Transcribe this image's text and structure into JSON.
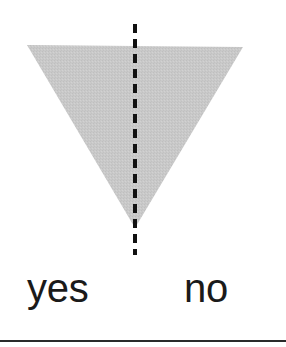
{
  "figure": {
    "canvas": {
      "width": 286,
      "height": 347,
      "background_color": "#ffffff"
    },
    "shape": {
      "name": "inverted-triangle",
      "type": "triangle",
      "orientation": "point-down",
      "fill_color": "#c9c9c9",
      "texture": "dithered-halftone",
      "vertices": [
        {
          "x": 27,
          "y": 45
        },
        {
          "x": 243,
          "y": 47
        },
        {
          "x": 135,
          "y": 228
        }
      ]
    },
    "symmetry_line": {
      "name": "vertical-dashed-axis",
      "orientation": "vertical",
      "color": "#111111",
      "x": 135,
      "y_start": 24,
      "y_end": 255,
      "stroke_width": 4,
      "dash_length": 9,
      "gap_length": 6
    },
    "labels": {
      "yes": "yes",
      "no": "no"
    },
    "divider": {
      "name": "bottom-rule",
      "color": "#2a2a2a",
      "y": 340,
      "thickness": 2,
      "x_start": 0,
      "x_end": 286
    }
  }
}
